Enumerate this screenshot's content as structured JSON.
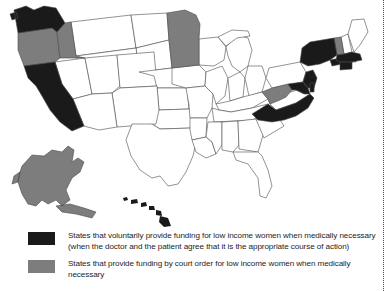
{
  "map": {
    "title": "United States state funding map",
    "projection": "albers-usa",
    "colors": {
      "voluntary": "#1a1a1a",
      "court_order": "#7d7d7d",
      "none": "#ffffff",
      "border": "#4a4a4a"
    },
    "categories": {
      "voluntary": "States that voluntarily provide funding for low income women when medically necessary",
      "court_order": "States that provide funding by court order for low income women when medically necessary"
    },
    "states_voluntary": [
      "Washington",
      "California",
      "New York",
      "Massachusetts",
      "Connecticut",
      "New Jersey",
      "Maryland",
      "North Carolina",
      "Hawaii"
    ],
    "states_court_order": [
      "Oregon",
      "Idaho",
      "Minnesota",
      "Vermont",
      "West Virginia",
      "Alaska"
    ],
    "states_none": [
      "Arizona",
      "New Mexico",
      "Nevada",
      "Utah",
      "Montana",
      "Wyoming",
      "Colorado",
      "North Dakota",
      "South Dakota",
      "Nebraska",
      "Kansas",
      "Oklahoma",
      "Texas",
      "Iowa",
      "Missouri",
      "Arkansas",
      "Louisiana",
      "Wisconsin",
      "Illinois",
      "Michigan",
      "Indiana",
      "Ohio",
      "Kentucky",
      "Tennessee",
      "Mississippi",
      "Alabama",
      "Georgia",
      "Florida",
      "South Carolina",
      "Virginia",
      "Pennsylvania",
      "Delaware",
      "Rhode Island",
      "New Hampshire",
      "Maine"
    ]
  },
  "legend": {
    "items": [
      {
        "swatch": "black",
        "line1": "States that voluntarily provide funding for low income women when medically necessary",
        "line2": "(when the doctor and the patient agree that it is the appropriate course of action)"
      },
      {
        "swatch": "gray",
        "line1": "States that provide funding by court order for low income women when medically",
        "line2": "necessary"
      }
    ]
  }
}
